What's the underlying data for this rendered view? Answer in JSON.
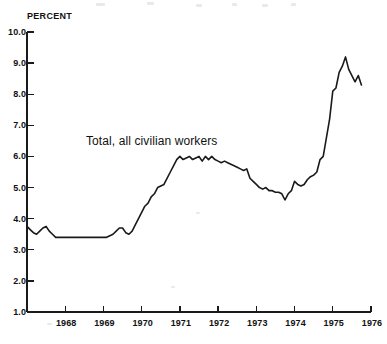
{
  "document": {
    "kind": "statistical-line-chart",
    "background_color": "#ffffff",
    "ink_color": "#1a1a1a"
  },
  "axes": {
    "y_axis_title": "PERCENT",
    "y_tick_labels": [
      "10.0",
      "9.0",
      "8.0",
      "7.0",
      "6.0",
      "5.0",
      "4.0",
      "3.0",
      "2.0",
      "1.0"
    ],
    "x_tick_labels": [
      "1968",
      "1969",
      "1970",
      "1971",
      "1972",
      "1973",
      "1974",
      "1975",
      "1976"
    ]
  },
  "annotations": {
    "series_label": "Total, all civilian workers"
  },
  "chart_data": {
    "type": "line",
    "title": "",
    "subtitle": "",
    "xlabel": "",
    "ylabel": "PERCENT",
    "series_name": "Total, all civilian workers",
    "grid": false,
    "legend_position": "inline-annotation",
    "ylim": [
      1.0,
      10.0
    ],
    "ytick_step": 1.0,
    "xlim": [
      1967.0,
      1976.0
    ],
    "xtick_step": 1.0,
    "x_unit": "decimal year (monthly observations)",
    "y_unit": "percent unemployed",
    "line_color": "#1a1a1a",
    "line_width": 1.6,
    "x": [
      1967.0,
      1967.083,
      1967.167,
      1967.25,
      1967.333,
      1967.417,
      1967.5,
      1967.583,
      1967.667,
      1967.75,
      1967.833,
      1967.917,
      1968.0,
      1968.083,
      1968.167,
      1968.25,
      1968.333,
      1968.417,
      1968.5,
      1968.583,
      1968.667,
      1968.75,
      1968.833,
      1968.917,
      1969.0,
      1969.083,
      1969.167,
      1969.25,
      1969.333,
      1969.417,
      1969.5,
      1969.583,
      1969.667,
      1969.75,
      1969.833,
      1969.917,
      1970.0,
      1970.083,
      1970.167,
      1970.25,
      1970.333,
      1970.417,
      1970.5,
      1970.583,
      1970.667,
      1970.75,
      1970.833,
      1970.917,
      1971.0,
      1971.083,
      1971.167,
      1971.25,
      1971.333,
      1971.417,
      1971.5,
      1971.583,
      1971.667,
      1971.75,
      1971.833,
      1971.917,
      1972.0,
      1972.083,
      1972.167,
      1972.25,
      1972.333,
      1972.417,
      1972.5,
      1972.583,
      1972.667,
      1972.75,
      1972.833,
      1972.917,
      1973.0,
      1973.083,
      1973.167,
      1973.25,
      1973.333,
      1973.417,
      1973.5,
      1973.583,
      1973.667,
      1973.75,
      1973.833,
      1973.917,
      1974.0,
      1974.083,
      1974.167,
      1974.25,
      1974.333,
      1974.417,
      1974.5,
      1974.583,
      1974.667,
      1974.75,
      1974.833,
      1974.917,
      1975.0,
      1975.083,
      1975.167,
      1975.25,
      1975.333,
      1975.417,
      1975.5,
      1975.583,
      1975.667,
      1975.75
    ],
    "values": [
      3.75,
      3.65,
      3.55,
      3.5,
      3.6,
      3.7,
      3.75,
      3.6,
      3.5,
      3.4,
      3.4,
      3.4,
      3.4,
      3.4,
      3.4,
      3.4,
      3.4,
      3.4,
      3.4,
      3.4,
      3.4,
      3.4,
      3.4,
      3.4,
      3.4,
      3.4,
      3.45,
      3.5,
      3.6,
      3.7,
      3.7,
      3.55,
      3.5,
      3.6,
      3.8,
      4.0,
      4.2,
      4.4,
      4.5,
      4.7,
      4.8,
      5.0,
      5.05,
      5.1,
      5.3,
      5.5,
      5.7,
      5.9,
      6.0,
      5.9,
      5.95,
      6.0,
      5.9,
      5.95,
      6.0,
      5.85,
      6.0,
      5.9,
      6.0,
      5.9,
      5.85,
      5.8,
      5.85,
      5.8,
      5.75,
      5.7,
      5.65,
      5.6,
      5.55,
      5.6,
      5.3,
      5.2,
      5.1,
      5.0,
      4.95,
      5.0,
      4.9,
      4.9,
      4.85,
      4.85,
      4.8,
      4.6,
      4.8,
      4.9,
      5.2,
      5.1,
      5.05,
      5.1,
      5.25,
      5.35,
      5.4,
      5.5,
      5.9,
      6.0,
      6.6,
      7.2,
      8.1,
      8.2,
      8.7,
      8.9,
      9.2,
      8.8,
      8.6,
      8.4,
      8.6,
      8.3
    ],
    "notable_points": [
      {
        "label": "series start",
        "x": 1967.0,
        "y": 3.75
      },
      {
        "label": "late-1960s plateau",
        "x": 1968.5,
        "y": 3.4
      },
      {
        "label": "recession climb begins",
        "x": 1969.75,
        "y": 3.6
      },
      {
        "label": "first plateau high",
        "x": 1971.25,
        "y": 6.0
      },
      {
        "label": "trough",
        "x": 1973.75,
        "y": 4.6
      },
      {
        "label": "peak",
        "x": 1975.417,
        "y": 9.2
      },
      {
        "label": "series end",
        "x": 1975.75,
        "y": 8.3
      }
    ]
  },
  "geometry": {
    "plot_left": 27,
    "plot_right": 371,
    "y_top_px": 32,
    "y_bottom_px": 312,
    "y_top_value": 10.0,
    "y_bottom_value": 1.0,
    "x_left_value": 1967.0,
    "x_right_value": 1976.0,
    "y_tick_length": 7,
    "x_tick_length": 6
  }
}
